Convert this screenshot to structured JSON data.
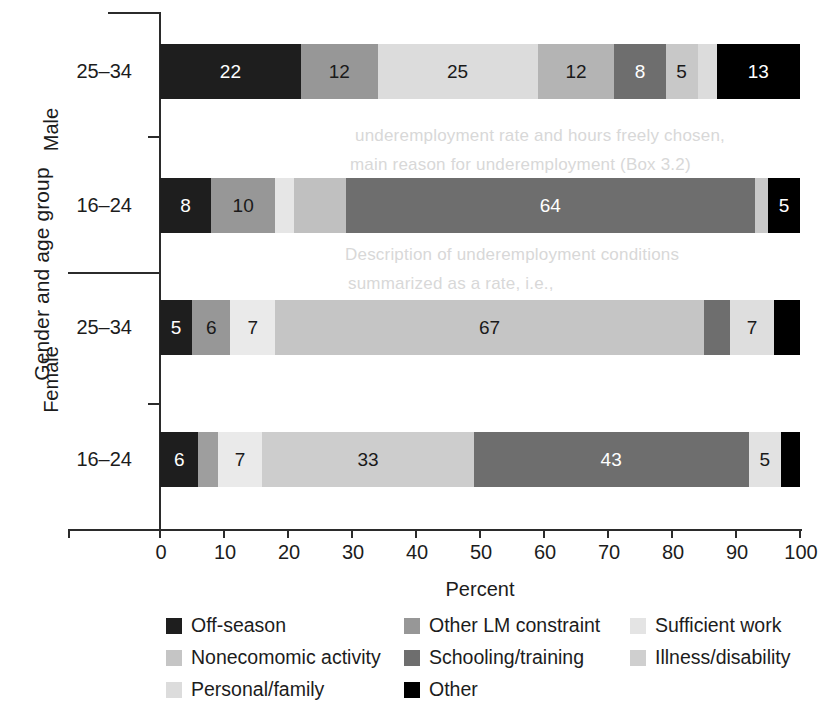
{
  "chart_data": {
    "type": "bar",
    "orientation": "horizontal",
    "stacked": true,
    "title": "",
    "xlabel": "Percent",
    "ylabel": "Gender and age group",
    "xlim": [
      0,
      100
    ],
    "xticks": [
      0,
      10,
      20,
      30,
      40,
      50,
      60,
      70,
      80,
      90,
      100
    ],
    "grid": false,
    "legend_position": "bottom",
    "categories": [
      "Off-season",
      "Other LM constraint",
      "Sufficient work",
      "Nonecomomic activity",
      "Schooling/training",
      "Illness/disability",
      "Personal/family",
      "Other"
    ],
    "groups": [
      {
        "name": "Male",
        "bars": [
          "25–34",
          "16–24"
        ]
      },
      {
        "name": "Female",
        "bars": [
          "25–34",
          "16–24"
        ]
      }
    ],
    "bars": [
      {
        "group": "Male",
        "age": "25–34",
        "segments": [
          {
            "category": "Off-season",
            "value": 22,
            "label": "22",
            "color": "#1e1e1e",
            "text_color": "#ffffff"
          },
          {
            "category": "Other LM constraint",
            "value": 12,
            "label": "12",
            "color": "#979797",
            "text_color": "#1a1a1a"
          },
          {
            "category": "Sufficient work",
            "value": 25,
            "label": "25",
            "color": "#dcdcdc",
            "text_color": "#1a1a1a"
          },
          {
            "category": "Nonecomomic activity",
            "value": 12,
            "label": "12",
            "color": "#b4b4b4",
            "text_color": "#1a1a1a"
          },
          {
            "category": "Schooling/training",
            "value": 8,
            "label": "8",
            "color": "#6e6e6e",
            "text_color": "#ffffff"
          },
          {
            "category": "Illness/disability",
            "value": 5,
            "label": "5",
            "color": "#c8c8c8",
            "text_color": "#1a1a1a"
          },
          {
            "category": "Personal/family",
            "value": 3,
            "label": "",
            "color": "#dcdcdc",
            "text_color": "#1a1a1a"
          },
          {
            "category": "Other",
            "value": 13,
            "label": "13",
            "color": "#000000",
            "text_color": "#ffffff"
          }
        ]
      },
      {
        "group": "Male",
        "age": "16–24",
        "segments": [
          {
            "category": "Off-season",
            "value": 8,
            "label": "8",
            "color": "#1e1e1e",
            "text_color": "#ffffff"
          },
          {
            "category": "Other LM constraint",
            "value": 10,
            "label": "10",
            "color": "#979797",
            "text_color": "#1a1a1a"
          },
          {
            "category": "Sufficient work",
            "value": 3,
            "label": "",
            "color": "#e6e6e6",
            "text_color": "#1a1a1a"
          },
          {
            "category": "Nonecomomic activity",
            "value": 8,
            "label": "",
            "color": "#c0c0c0",
            "text_color": "#1a1a1a"
          },
          {
            "category": "Schooling/training",
            "value": 64,
            "label": "64",
            "color": "#6e6e6e",
            "text_color": "#ffffff"
          },
          {
            "category": "Illness/disability",
            "value": 2,
            "label": "",
            "color": "#c8c8c8",
            "text_color": "#1a1a1a"
          },
          {
            "category": "Other",
            "value": 5,
            "label": "5",
            "color": "#000000",
            "text_color": "#ffffff"
          }
        ]
      },
      {
        "group": "Female",
        "age": "25–34",
        "segments": [
          {
            "category": "Off-season",
            "value": 5,
            "label": "5",
            "color": "#1e1e1e",
            "text_color": "#ffffff"
          },
          {
            "category": "Other LM constraint",
            "value": 6,
            "label": "6",
            "color": "#979797",
            "text_color": "#1a1a1a"
          },
          {
            "category": "Sufficient work",
            "value": 7,
            "label": "7",
            "color": "#eaeaea",
            "text_color": "#1a1a1a"
          },
          {
            "category": "Nonecomomic activity",
            "value": 67,
            "label": "67",
            "color": "#c5c5c5",
            "text_color": "#1a1a1a"
          },
          {
            "category": "Schooling/training",
            "value": 4,
            "label": "",
            "color": "#6e6e6e",
            "text_color": "#ffffff"
          },
          {
            "category": "Illness/disability",
            "value": 7,
            "label": "7",
            "color": "#dedede",
            "text_color": "#1a1a1a"
          },
          {
            "category": "Other",
            "value": 4,
            "label": "",
            "color": "#000000",
            "text_color": "#ffffff"
          }
        ]
      },
      {
        "group": "Female",
        "age": "16–24",
        "segments": [
          {
            "category": "Off-season",
            "value": 6,
            "label": "6",
            "color": "#1e1e1e",
            "text_color": "#ffffff"
          },
          {
            "category": "Other LM constraint",
            "value": 3,
            "label": "",
            "color": "#9e9e9e",
            "text_color": "#1a1a1a"
          },
          {
            "category": "Sufficient work",
            "value": 7,
            "label": "7",
            "color": "#eaeaea",
            "text_color": "#1a1a1a"
          },
          {
            "category": "Nonecomomic activity",
            "value": 33,
            "label": "33",
            "color": "#cdcdcd",
            "text_color": "#1a1a1a"
          },
          {
            "category": "Schooling/training",
            "value": 43,
            "label": "43",
            "color": "#6e6e6e",
            "text_color": "#ffffff"
          },
          {
            "category": "Illness/disability",
            "value": 5,
            "label": "5",
            "color": "#e2e2e2",
            "text_color": "#1a1a1a"
          },
          {
            "category": "Other",
            "value": 3,
            "label": "",
            "color": "#000000",
            "text_color": "#ffffff"
          }
        ]
      }
    ],
    "legend": [
      {
        "label": "Off-season",
        "color": "#1e1e1e",
        "col": 0,
        "row": 0
      },
      {
        "label": "Nonecomomic activity",
        "color": "#c5c5c5",
        "col": 0,
        "row": 1
      },
      {
        "label": "Personal/family",
        "color": "#dcdcdc",
        "col": 0,
        "row": 2
      },
      {
        "label": "Other LM constraint",
        "color": "#979797",
        "col": 1,
        "row": 0
      },
      {
        "label": "Schooling/training",
        "color": "#6e6e6e",
        "col": 1,
        "row": 1
      },
      {
        "label": "Other",
        "color": "#000000",
        "col": 1,
        "row": 2
      },
      {
        "label": "Sufficient work",
        "color": "#e4e4e4",
        "col": 2,
        "row": 0
      },
      {
        "label": "Illness/disability",
        "color": "#cfcfcf",
        "col": 2,
        "row": 1
      }
    ]
  },
  "ghost_text": [
    {
      "text": "underemployment rate and hours freely chosen,",
      "x": 355,
      "y": 126
    },
    {
      "text": "main reason for underemployment (Box 3.2)",
      "x": 350,
      "y": 155
    },
    {
      "text": "Description of underemployment conditions",
      "x": 345,
      "y": 245
    },
    {
      "text": "summarized as a rate, i.e.,",
      "x": 348,
      "y": 274
    }
  ]
}
